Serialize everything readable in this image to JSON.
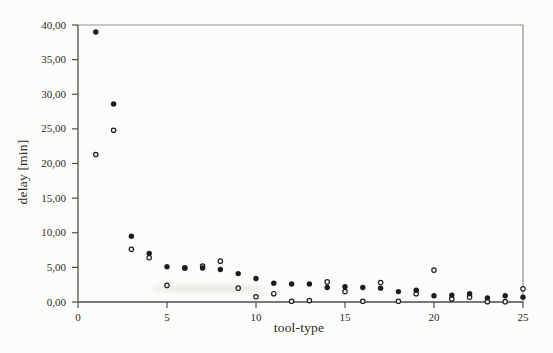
{
  "chart_data": {
    "type": "scatter",
    "title": "",
    "xlabel": "tool-type",
    "ylabel": "delay [min]",
    "xlim": [
      0,
      25
    ],
    "ylim": [
      0,
      40
    ],
    "grid": false,
    "legend": "none",
    "x_tick_values": [
      0,
      5,
      10,
      15,
      20,
      25
    ],
    "x_tick_labels": [
      "0",
      "5",
      "10",
      "15",
      "20",
      "25"
    ],
    "y_tick_values": [
      0,
      5,
      10,
      15,
      20,
      25,
      30,
      35,
      40
    ],
    "y_tick_labels": [
      "0,00",
      "5,00",
      "10,00",
      "15,00",
      "20,00",
      "25,00",
      "30,00",
      "35,00",
      "40,00"
    ],
    "x": [
      1,
      2,
      3,
      4,
      5,
      6,
      7,
      8,
      9,
      10,
      11,
      12,
      13,
      14,
      15,
      16,
      17,
      18,
      19,
      20,
      21,
      22,
      23,
      24,
      25
    ],
    "series": [
      {
        "name": "open-circle-series",
        "marker": "open-circle",
        "values": [
          21.3,
          24.8,
          7.6,
          6.4,
          2.4,
          4.9,
          5.2,
          5.9,
          2.0,
          0.75,
          1.2,
          0.1,
          0.2,
          2.9,
          1.5,
          0.1,
          2.8,
          0.1,
          1.2,
          4.6,
          0.45,
          0.7,
          0.05,
          0.05,
          1.9
        ]
      },
      {
        "name": "filled-circle-series",
        "marker": "filled-circle",
        "values": [
          39.0,
          28.6,
          9.5,
          7.0,
          5.1,
          4.9,
          4.9,
          4.7,
          4.1,
          3.4,
          2.7,
          2.6,
          2.6,
          2.1,
          2.2,
          2.1,
          2.0,
          1.5,
          1.7,
          0.9,
          1.0,
          1.2,
          0.6,
          0.9,
          0.7
        ]
      }
    ],
    "colors": {
      "ink": "#1c1c1c",
      "axis": "#4c4c48",
      "frame": "#8d8d88",
      "paper": "#fcfcfa",
      "tick_text": "#2a2a26"
    }
  }
}
